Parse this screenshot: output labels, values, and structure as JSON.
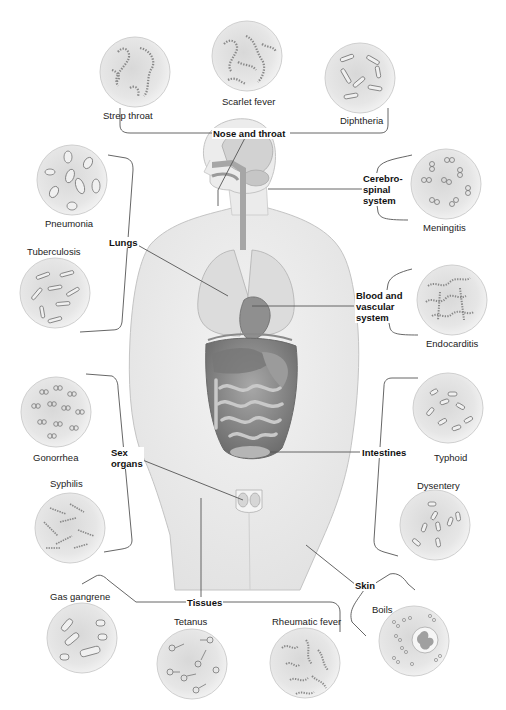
{
  "diagram": {
    "type": "anatomical-infection-map"
  },
  "systems": [
    {
      "id": "nose-throat",
      "label": "Nose and throat",
      "diseases": [
        "Strep throat",
        "Scarlet fever",
        "Diphtheria"
      ]
    },
    {
      "id": "lungs",
      "label": "Lungs",
      "diseases": [
        "Pneumonia",
        "Tuberculosis"
      ]
    },
    {
      "id": "cerebrospinal",
      "label": "Cerebro-\nspinal\nsystem",
      "diseases": [
        "Meningitis"
      ]
    },
    {
      "id": "blood",
      "label": "Blood and\nvascular\nsystem",
      "diseases": [
        "Endocarditis"
      ]
    },
    {
      "id": "sex-organs",
      "label": "Sex\norgans",
      "diseases": [
        "Gonorrhea",
        "Syphilis"
      ]
    },
    {
      "id": "intestines",
      "label": "Intestines",
      "diseases": [
        "Typhoid",
        "Dysentery"
      ]
    },
    {
      "id": "tissues",
      "label": "Tissues",
      "diseases": [
        "Gas gangrene",
        "Tetanus",
        "Rheumatic fever"
      ]
    },
    {
      "id": "skin",
      "label": "Skin",
      "diseases": [
        "Boils"
      ]
    }
  ],
  "diseases": {
    "strep_throat": "Strep throat",
    "scarlet_fever": "Scarlet fever",
    "diphtheria": "Diphtheria",
    "pneumonia": "Pneumonia",
    "tuberculosis": "Tuberculosis",
    "meningitis": "Meningitis",
    "endocarditis": "Endocarditis",
    "gonorrhea": "Gonorrhea",
    "syphilis": "Syphilis",
    "typhoid": "Typhoid",
    "dysentery": "Dysentery",
    "gas_gangrene": "Gas gangrene",
    "tetanus": "Tetanus",
    "rheumatic_fever": "Rheumatic fever",
    "boils": "Boils"
  },
  "labels": {
    "nose_throat": "Nose and throat",
    "lungs": "Lungs",
    "cerebrospinal": "Cerebro-\nspinal\nsystem",
    "blood": "Blood and\nvascular\nsystem",
    "sex_organs": "Sex\norgans",
    "intestines": "Intestines",
    "tissues": "Tissues",
    "skin": "Skin"
  },
  "colors": {
    "line": "#555555",
    "body_fill": "#ededed",
    "body_edge": "#bdbdbd",
    "micro_fill": "#e4e4e4",
    "organ_dark": "#8a8a8a"
  }
}
